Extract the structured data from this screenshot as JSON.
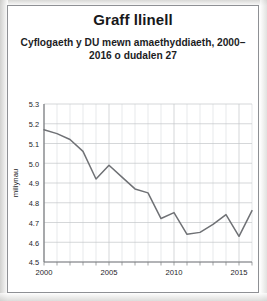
{
  "chart_data": {
    "type": "line",
    "title": "Graff llinell",
    "subtitle": "Cyflogaeth y DU mewn amaethyddiaeth, 2000–2016 o dudalen 27",
    "xlabel": "",
    "ylabel": "miliynau",
    "x": [
      2000,
      2001,
      2002,
      2003,
      2004,
      2005,
      2006,
      2007,
      2008,
      2009,
      2010,
      2011,
      2012,
      2013,
      2014,
      2015,
      2016
    ],
    "values": [
      5.17,
      5.15,
      5.12,
      5.06,
      4.92,
      4.99,
      4.93,
      4.87,
      4.85,
      4.72,
      4.75,
      4.64,
      4.65,
      4.69,
      4.74,
      4.63,
      4.76
    ],
    "series": [
      {
        "name": "Cyflogaeth y DU mewn amaethyddiaeth",
        "values": [
          5.17,
          5.15,
          5.12,
          5.06,
          4.92,
          4.99,
          4.93,
          4.87,
          4.85,
          4.72,
          4.75,
          4.64,
          4.65,
          4.69,
          4.74,
          4.63,
          4.76
        ]
      }
    ],
    "ylim": [
      4.5,
      5.3
    ],
    "xlim": [
      2000,
      2016
    ],
    "ytick_labels": [
      "4.5",
      "4.6",
      "4.7",
      "4.8",
      "4.9",
      "5.0",
      "5.1",
      "5.2",
      "5.3"
    ],
    "ytick_values": [
      4.5,
      4.6,
      4.7,
      4.8,
      4.9,
      5.0,
      5.1,
      5.2,
      5.3
    ],
    "xtick_labels": [
      "2000",
      "2005",
      "2010",
      "2015"
    ],
    "xtick_values": [
      2000,
      2005,
      2010,
      2015
    ],
    "x_minor_ticks": [
      2000,
      2001,
      2002,
      2003,
      2004,
      2005,
      2006,
      2007,
      2008,
      2009,
      2010,
      2011,
      2012,
      2013,
      2014,
      2015,
      2016
    ],
    "grid": true,
    "legend": "none",
    "line_color": "#6f7175",
    "grid_color": "#c3c5c8",
    "axis_color": "#7a7c80",
    "text_color": "#1c1d1f"
  }
}
